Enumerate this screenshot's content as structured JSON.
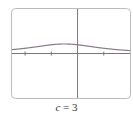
{
  "chart_data": {
    "type": "line",
    "title": "",
    "caption_var": "c",
    "caption_eq": " = ",
    "caption_val": "3",
    "function": "1/(x^2 + x + c)",
    "parameter": {
      "c": 3
    },
    "xlim": [
      -2.5,
      2
    ],
    "ylim": [
      -1.7,
      1.7
    ],
    "x_ticks": [
      -2,
      -1,
      1
    ],
    "grid": false,
    "series": [
      {
        "name": "f(x)",
        "x": [
          -2.5,
          -2,
          -1.5,
          -1,
          -0.5,
          0,
          0.5,
          1,
          1.5,
          2
        ],
        "y": [
          0.148,
          0.2,
          0.267,
          0.333,
          0.364,
          0.333,
          0.267,
          0.2,
          0.148,
          0.111
        ]
      }
    ],
    "colors": {
      "curve": "#8a7a8c",
      "axes": "#777777",
      "frame": "#bbbbbb"
    }
  }
}
